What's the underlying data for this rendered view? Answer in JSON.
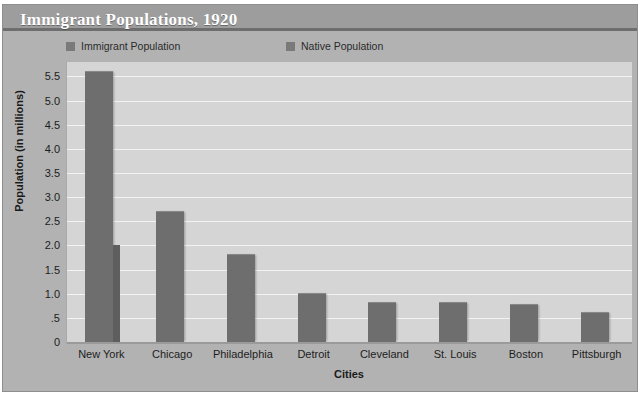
{
  "chart_data": {
    "type": "bar",
    "title": "Immigrant Populations, 1920",
    "xlabel": "Cities",
    "ylabel": "Population (in millions)",
    "categories": [
      "New York",
      "Chicago",
      "Philadelphia",
      "Detroit",
      "Cleveland",
      "St. Louis",
      "Boston",
      "Pittsburgh"
    ],
    "series": [
      {
        "name": "Immigrant Population",
        "color": "#6e6e6e",
        "values": [
          5.6,
          2.7,
          1.8,
          1.0,
          0.8,
          0.8,
          0.77,
          0.6
        ]
      },
      {
        "name": "Native Population",
        "color": "#5e5e5e",
        "values": [
          2.0,
          0.0,
          0.0,
          0.0,
          0.0,
          0.0,
          0.0,
          0.0
        ]
      }
    ],
    "ylim": [
      0,
      5.8
    ],
    "yticks": [
      0,
      0.5,
      1.0,
      1.5,
      2.0,
      2.5,
      3.0,
      3.5,
      4.0,
      4.5,
      5.0,
      5.5
    ],
    "ytick_labels": [
      "0",
      ".5",
      "1.0",
      "1.5",
      "2.0",
      "2.5",
      "3.0",
      "3.5",
      "4.0",
      "4.5",
      "5.0",
      "5.5"
    ],
    "grid": true,
    "legend_position": "top"
  },
  "style": {
    "plot_background": "#d5d5d5",
    "figure_background": "#b2b2b2",
    "title_band": "#9d9d9d",
    "title_color": "#ffffff",
    "gridline_color": "#f2f2f2"
  }
}
